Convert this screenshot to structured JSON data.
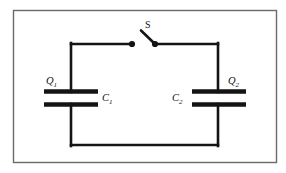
{
  "figure": {
    "background_color": "#ffffff",
    "wire_color": "#141414",
    "border_color": "#6b6b6b"
  },
  "labels": {
    "charge_left": "Q",
    "charge_left_sub": "1",
    "charge_right": "Q",
    "charge_right_sub": "2",
    "capacitor_left": "C",
    "capacitor_left_sub": "1",
    "capacitor_right": "C",
    "capacitor_right_sub": "2",
    "switch": "S"
  },
  "components": [
    {
      "name": "capacitor-left",
      "symbol": "C",
      "subscript": "1",
      "charge_symbol": "Q",
      "charge_subscript": "1"
    },
    {
      "name": "capacitor-right",
      "symbol": "C",
      "subscript": "2",
      "charge_symbol": "Q",
      "charge_subscript": "2"
    },
    {
      "name": "switch",
      "symbol": "S",
      "state": "open"
    }
  ],
  "geometry": {
    "frame": {
      "x": 13,
      "y": 10,
      "width": 264,
      "height": 153
    },
    "wire_left_x": 71,
    "wire_right_x": 218,
    "wire_top_y": 44,
    "wire_bottom_y": 145,
    "switch_dot_left_x": 132,
    "switch_dot_right_x": 155,
    "switch_lever_tip_x": 141,
    "switch_lever_tip_y": 31,
    "plate_gap_top_y": 91,
    "plate_gap_bottom_y": 104,
    "plate_left_x1": 44,
    "plate_left_x2": 98,
    "plate_right_x1": 192,
    "plate_right_x2": 246
  }
}
